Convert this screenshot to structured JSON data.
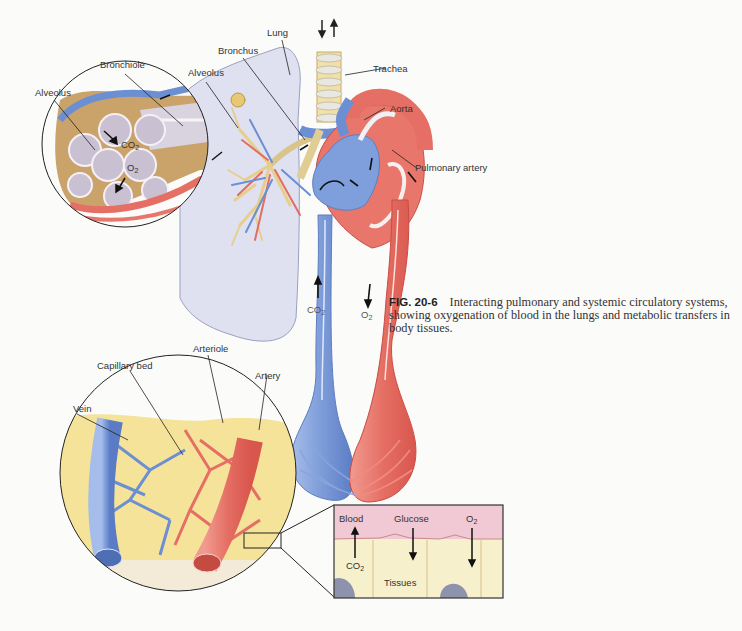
{
  "figure": {
    "number": "FIG. 20-6",
    "caption": "Interacting pulmonary and systemic circulatory systems, showing oxygenation of blood in the lungs and metabolic transfers in body tissues."
  },
  "labels": {
    "lung": "Lung",
    "bronchus": "Bronchus",
    "bronchiole": "Bronchiole",
    "alveolus_inset": "Alveolus",
    "alveolus_lung": "Alveolus",
    "trachea": "Trachea",
    "aorta": "Aorta",
    "pulmonary_artery": "Pulmonary artery",
    "capillary_bed": "Capillary bed",
    "arteriole": "Arteriole",
    "artery": "Artery",
    "vein": "Vein"
  },
  "gases": {
    "co2_base": "CO",
    "o2_base": "O",
    "subscript": "2",
    "alveolus_co2": "CO",
    "alveolus_o2": "O",
    "vessel_co2": "CO",
    "vessel_o2": "O"
  },
  "tissue_inset": {
    "blood": "Blood",
    "glucose": "Glucose",
    "o2": "O",
    "co2": "CO",
    "tissues": "Tissues"
  },
  "colors": {
    "oxygenated": "#e8756a",
    "deoxygenated": "#7b9bd8",
    "lung": "#dcdff0",
    "airway": "#efd9a0",
    "tissue": "#f7efc8",
    "blood_plasma": "#f0c8d2"
  }
}
